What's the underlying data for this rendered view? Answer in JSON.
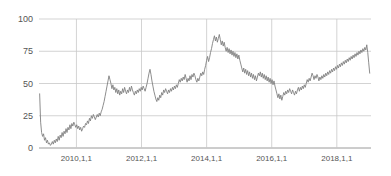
{
  "chart_data": {
    "type": "line",
    "title": "",
    "subtitle": "",
    "xlabel": "",
    "ylabel": "",
    "xlim": [
      2008.85,
      2019.05
    ],
    "ylim": [
      0,
      100
    ],
    "grid": true,
    "legend": null,
    "legend_position": "none",
    "line_color": "#808080",
    "grid_color": "#c8c8c8",
    "axis_color": "#9a9a9a",
    "tick_label_color": "#555555",
    "y_ticks": [
      0,
      25,
      50,
      75,
      100
    ],
    "y_tick_labels": [
      "0",
      "25",
      "50",
      "75",
      "100"
    ],
    "x_ticks": [
      2010,
      2012,
      2014,
      2016,
      2018
    ],
    "x_tick_labels": [
      "2010,1,1",
      "2012,1,1",
      "2014,1,1",
      "2016,1,1",
      "2018,1,1"
    ],
    "series": [
      {
        "name": "value",
        "color": "#808080",
        "x": [
          2008.87,
          2008.9,
          2008.93,
          2008.96,
          2008.99,
          2009.02,
          2009.05,
          2009.08,
          2009.11,
          2009.14,
          2009.17,
          2009.2,
          2009.23,
          2009.26,
          2009.29,
          2009.32,
          2009.35,
          2009.38,
          2009.41,
          2009.44,
          2009.47,
          2009.5,
          2009.53,
          2009.56,
          2009.59,
          2009.62,
          2009.65,
          2009.68,
          2009.71,
          2009.74,
          2009.77,
          2009.8,
          2009.83,
          2009.86,
          2009.89,
          2009.92,
          2009.95,
          2009.98,
          2010.01,
          2010.04,
          2010.07,
          2010.1,
          2010.13,
          2010.16,
          2010.19,
          2010.22,
          2010.25,
          2010.28,
          2010.31,
          2010.34,
          2010.37,
          2010.4,
          2010.43,
          2010.46,
          2010.49,
          2010.52,
          2010.55,
          2010.58,
          2010.61,
          2010.64,
          2010.67,
          2010.7,
          2010.73,
          2010.76,
          2010.79,
          2010.82,
          2010.85,
          2010.88,
          2010.91,
          2010.94,
          2010.97,
          2011.0,
          2011.03,
          2011.06,
          2011.09,
          2011.12,
          2011.15,
          2011.18,
          2011.21,
          2011.24,
          2011.27,
          2011.3,
          2011.33,
          2011.36,
          2011.39,
          2011.42,
          2011.45,
          2011.48,
          2011.51,
          2011.54,
          2011.57,
          2011.6,
          2011.63,
          2011.66,
          2011.69,
          2011.72,
          2011.75,
          2011.78,
          2011.81,
          2011.84,
          2011.87,
          2011.9,
          2011.93,
          2011.96,
          2011.99,
          2012.02,
          2012.05,
          2012.08,
          2012.11,
          2012.14,
          2012.17,
          2012.2,
          2012.23,
          2012.26,
          2012.29,
          2012.32,
          2012.35,
          2012.38,
          2012.41,
          2012.44,
          2012.47,
          2012.5,
          2012.53,
          2012.56,
          2012.59,
          2012.62,
          2012.65,
          2012.68,
          2012.71,
          2012.74,
          2012.77,
          2012.8,
          2012.83,
          2012.86,
          2012.89,
          2012.92,
          2012.95,
          2012.98,
          2013.01,
          2013.04,
          2013.07,
          2013.1,
          2013.13,
          2013.16,
          2013.19,
          2013.22,
          2013.25,
          2013.28,
          2013.31,
          2013.34,
          2013.37,
          2013.4,
          2013.43,
          2013.46,
          2013.49,
          2013.52,
          2013.55,
          2013.58,
          2013.61,
          2013.64,
          2013.67,
          2013.7,
          2013.73,
          2013.76,
          2013.79,
          2013.82,
          2013.85,
          2013.88,
          2013.91,
          2013.94,
          2013.97,
          2014.0,
          2014.03,
          2014.06,
          2014.09,
          2014.12,
          2014.15,
          2014.18,
          2014.21,
          2014.24,
          2014.27,
          2014.3,
          2014.33,
          2014.36,
          2014.39,
          2014.42,
          2014.45,
          2014.48,
          2014.51,
          2014.54,
          2014.57,
          2014.6,
          2014.63,
          2014.66,
          2014.69,
          2014.72,
          2014.75,
          2014.78,
          2014.81,
          2014.84,
          2014.87,
          2014.9,
          2014.93,
          2014.96,
          2014.99,
          2015.02,
          2015.05,
          2015.08,
          2015.11,
          2015.14,
          2015.17,
          2015.2,
          2015.23,
          2015.26,
          2015.29,
          2015.32,
          2015.35,
          2015.38,
          2015.41,
          2015.44,
          2015.47,
          2015.5,
          2015.53,
          2015.56,
          2015.59,
          2015.62,
          2015.65,
          2015.68,
          2015.71,
          2015.74,
          2015.77,
          2015.8,
          2015.83,
          2015.86,
          2015.89,
          2015.92,
          2015.95,
          2015.98,
          2016.01,
          2016.04,
          2016.07,
          2016.1,
          2016.13,
          2016.16,
          2016.19,
          2016.22,
          2016.25,
          2016.28,
          2016.31,
          2016.34,
          2016.37,
          2016.4,
          2016.43,
          2016.46,
          2016.49,
          2016.52,
          2016.55,
          2016.58,
          2016.61,
          2016.64,
          2016.67,
          2016.7,
          2016.73,
          2016.76,
          2016.79,
          2016.82,
          2016.85,
          2016.88,
          2016.91,
          2016.94,
          2016.97,
          2017.0,
          2017.03,
          2017.06,
          2017.09,
          2017.12,
          2017.15,
          2017.18,
          2017.21,
          2017.24,
          2017.27,
          2017.3,
          2017.33,
          2017.36,
          2017.39,
          2017.42,
          2017.45,
          2017.48,
          2017.51,
          2017.54,
          2017.57,
          2017.6,
          2017.63,
          2017.66,
          2017.69,
          2017.72,
          2017.75,
          2017.78,
          2017.81,
          2017.84,
          2017.87,
          2017.9,
          2017.93,
          2017.96,
          2017.99,
          2018.02,
          2018.05,
          2018.08,
          2018.11,
          2018.14,
          2018.17,
          2018.2,
          2018.23,
          2018.26,
          2018.29,
          2018.32,
          2018.35,
          2018.38,
          2018.41,
          2018.44,
          2018.47,
          2018.5,
          2018.53,
          2018.56,
          2018.59,
          2018.62,
          2018.65,
          2018.68,
          2018.71,
          2018.74,
          2018.77,
          2018.8,
          2018.83,
          2018.86,
          2018.89,
          2018.92,
          2018.95,
          2018.98,
          2019.01
        ],
        "y": [
          42,
          20,
          12,
          9,
          11,
          6,
          8,
          4,
          6,
          3,
          4,
          2,
          3,
          5,
          3,
          6,
          4,
          7,
          5,
          9,
          6,
          10,
          8,
          12,
          9,
          13,
          11,
          15,
          12,
          16,
          14,
          18,
          15,
          19,
          17,
          20,
          18,
          16,
          18,
          15,
          17,
          14,
          16,
          13,
          15,
          17,
          16,
          19,
          18,
          21,
          19,
          23,
          21,
          25,
          23,
          26,
          24,
          22,
          24,
          26,
          24,
          27,
          25,
          28,
          30,
          33,
          36,
          40,
          44,
          48,
          52,
          56,
          53,
          50,
          46,
          49,
          45,
          47,
          43,
          46,
          42,
          45,
          41,
          44,
          42,
          46,
          43,
          47,
          44,
          42,
          45,
          43,
          47,
          44,
          48,
          45,
          43,
          41,
          44,
          42,
          45,
          43,
          46,
          44,
          47,
          45,
          48,
          46,
          44,
          47,
          50,
          54,
          58,
          61,
          57,
          52,
          48,
          44,
          41,
          38,
          36,
          39,
          37,
          41,
          39,
          43,
          41,
          45,
          43,
          46,
          44,
          42,
          45,
          43,
          46,
          44,
          47,
          45,
          48,
          46,
          49,
          47,
          50,
          53,
          51,
          54,
          52,
          55,
          53,
          57,
          54,
          51,
          54,
          52,
          56,
          53,
          57,
          55,
          58,
          56,
          53,
          51,
          54,
          52,
          55,
          58,
          56,
          59,
          57,
          61,
          64,
          68,
          71,
          67,
          70,
          74,
          77,
          81,
          84,
          87,
          83,
          86,
          82,
          85,
          88,
          84,
          80,
          83,
          79,
          82,
          78,
          75,
          78,
          74,
          77,
          73,
          76,
          72,
          75,
          71,
          74,
          70,
          73,
          69,
          72,
          68,
          65,
          62,
          59,
          62,
          58,
          61,
          57,
          60,
          56,
          59,
          55,
          58,
          54,
          57,
          53,
          56,
          52,
          55,
          58,
          56,
          59,
          55,
          58,
          54,
          57,
          53,
          56,
          52,
          55,
          51,
          54,
          50,
          53,
          49,
          52,
          48,
          45,
          42,
          39,
          42,
          38,
          41,
          37,
          40,
          43,
          41,
          44,
          42,
          45,
          43,
          46,
          44,
          42,
          45,
          43,
          41,
          44,
          42,
          45,
          47,
          44,
          47,
          45,
          48,
          46,
          49,
          47,
          50,
          53,
          51,
          54,
          52,
          55,
          58,
          56,
          53,
          56,
          54,
          57,
          55,
          52,
          55,
          53,
          56,
          54,
          57,
          55,
          58,
          56,
          59,
          57,
          60,
          58,
          61,
          59,
          62,
          60,
          63,
          61,
          64,
          62,
          65,
          63,
          66,
          64,
          67,
          65,
          68,
          66,
          69,
          67,
          70,
          68,
          71,
          69,
          72,
          70,
          73,
          71,
          74,
          72,
          75,
          73,
          76,
          74,
          77,
          75,
          78,
          76,
          80,
          74,
          66,
          58
        ]
      }
    ]
  },
  "axes": {
    "plot_left_px": 39,
    "plot_right_px": 371,
    "plot_top_px": 19,
    "plot_bottom_px": 148
  }
}
